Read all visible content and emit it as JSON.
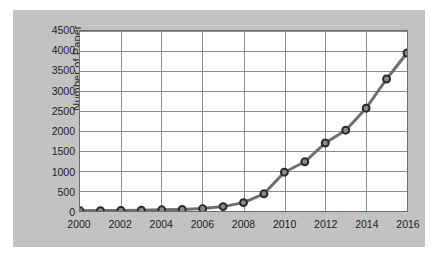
{
  "chart_data": {
    "type": "line",
    "title": "",
    "xlabel": "",
    "ylabel": "Number of Paper",
    "x": [
      2000,
      2001,
      2002,
      2003,
      2004,
      2005,
      2006,
      2007,
      2008,
      2009,
      2010,
      2011,
      2012,
      2013,
      2014,
      2015,
      2016
    ],
    "values": [
      5,
      10,
      15,
      20,
      30,
      40,
      60,
      110,
      210,
      430,
      970,
      1230,
      1700,
      2020,
      2570,
      3300,
      3950
    ],
    "series": [
      {
        "name": "Number of Paper",
        "values": [
          5,
          10,
          15,
          20,
          30,
          40,
          60,
          110,
          210,
          430,
          970,
          1230,
          1700,
          2020,
          2570,
          3300,
          3950
        ]
      }
    ],
    "xlim": [
      2000,
      2016
    ],
    "ylim": [
      0,
      4500
    ],
    "y_ticks": [
      0,
      500,
      1000,
      1500,
      2000,
      2500,
      3000,
      3500,
      4000,
      4500
    ],
    "y_tick_labels": [
      "0",
      "500",
      "1000",
      "1500",
      "2000",
      "2500",
      "3000",
      "3500",
      "4000",
      "4500"
    ],
    "x_ticks": [
      2000,
      2002,
      2004,
      2006,
      2008,
      2010,
      2012,
      2014,
      2016
    ],
    "x_tick_labels": [
      "2000",
      "2002",
      "2004",
      "2006",
      "2008",
      "2010",
      "2012",
      "2014",
      "2016"
    ],
    "x_minor_step": 1,
    "grid": {
      "horizontal": true,
      "vertical": true,
      "color": "#8c8c8c"
    },
    "legend": {
      "visible": false,
      "position": "none"
    },
    "marker": {
      "shape": "circle",
      "fill": "#8a8a8a",
      "edge": "#2b2b2b",
      "size": 7
    },
    "line": {
      "color": "#6e6e6e",
      "width": 3
    },
    "colors": {
      "page_background": "#ffffff",
      "panel_background": "#c2c2c2",
      "plot_background": "#ffffff",
      "plot_border": "#6d6d6d",
      "tick_text": "#1d1d1d",
      "axis_title": "#262626"
    }
  }
}
